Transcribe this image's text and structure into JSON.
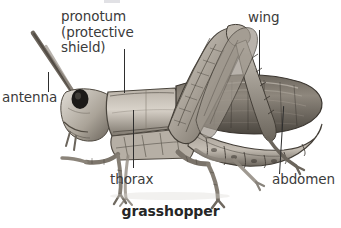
{
  "figure": {
    "caption": "grasshopper",
    "subject": "grasshopper",
    "style": "grayscale engraving illustration",
    "background_color": "#ffffff",
    "label_color": "#3b3b3b",
    "caption_color": "#262626",
    "leader_line_color": "#2e2e2e"
  },
  "labels": {
    "pronotum": {
      "line1": "pronotum",
      "line2": "(protective",
      "line3": "shield)",
      "full_text": "pronotum (protective shield)"
    },
    "antenna": "antenna",
    "wing": "wing",
    "thorax": "thorax",
    "abdomen": "abdomen"
  },
  "illustration": {
    "alt": "side view of a grasshopper facing left with antennae, head, pronotum, folded wing, segmented abdomen and large hind legs",
    "body_tone_light": "#cfc9c0",
    "body_tone_mid": "#8d867c",
    "body_tone_dark": "#4a453f",
    "eye_color": "#1c1a18"
  }
}
